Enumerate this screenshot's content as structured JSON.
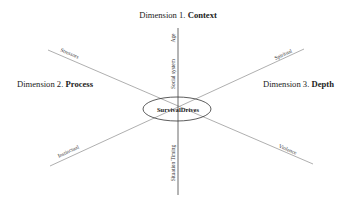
{
  "diagram": {
    "center": {
      "label": "SurvivalDrives"
    },
    "dimensions": [
      {
        "number_prefix": "Dimension 1. ",
        "name": "Context",
        "position": "top"
      },
      {
        "number_prefix": "Dimension 2. ",
        "name": "Process",
        "position": "left"
      },
      {
        "number_prefix": "Dimension 3. ",
        "name": "Depth",
        "position": "right"
      }
    ],
    "axis_labels": {
      "vertical_top_end": "Age",
      "vertical_top_mid": "Social system",
      "vertical_bottom": "Situation Timing",
      "upper_left": "Stressors",
      "lower_left": "Instinctual",
      "upper_right": "Spiritual",
      "lower_right": "Violence"
    },
    "colors": {
      "vertical_axis": "#444444",
      "diagonal_axes": "#9a9a9a",
      "ellipse": "#333333",
      "text": "#222222"
    }
  }
}
